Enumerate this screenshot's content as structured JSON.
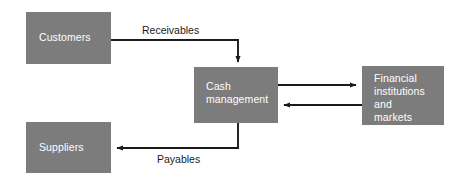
{
  "diagram": {
    "colors": {
      "node_fill": "#7c7c7c",
      "node_text": "#ffffff",
      "edge": "#1a1a1a",
      "background": "#ffffff"
    },
    "nodes": [
      {
        "id": "customers",
        "label": "Customers"
      },
      {
        "id": "suppliers",
        "label": "Suppliers"
      },
      {
        "id": "cash",
        "label": "Cash\nmanagement"
      },
      {
        "id": "financial",
        "label": "Financial\ninstitutions\nand\nmarkets"
      }
    ],
    "edges": [
      {
        "id": "receivables",
        "label": "Receivables",
        "from": "customers",
        "to": "cash",
        "arrow": "to"
      },
      {
        "id": "payables",
        "label": "Payables",
        "from": "cash",
        "to": "suppliers",
        "arrow": "to"
      },
      {
        "id": "cash-to-financial",
        "label": "",
        "from": "cash",
        "to": "financial",
        "arrow": "to"
      },
      {
        "id": "financial-to-cash",
        "label": "",
        "from": "financial",
        "to": "cash",
        "arrow": "to"
      }
    ]
  }
}
